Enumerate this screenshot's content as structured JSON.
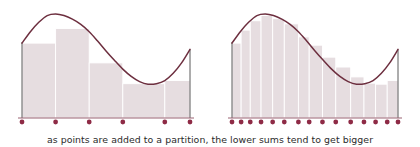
{
  "caption": "as points are added to a partition, the lower sums tend to get bigger",
  "colors": {
    "curve": "#6d2f3f",
    "bar_fill": "#e6dde0",
    "bar_edge": "#ffffff",
    "axis": "#5a5a5a",
    "dot": "#8e2b46",
    "baseline": "#9a6273",
    "background": "#ffffff",
    "caption_text": "#2b2b2b"
  },
  "chart_data": {
    "type": "area",
    "title": "",
    "subtitle": "",
    "xlabel": "",
    "ylabel": "",
    "grid": false,
    "legend": null,
    "panels": [
      {
        "name": "coarse-partition",
        "description": "lower sum rectangles over a coarse partition",
        "x_domain": [
          0,
          1
        ],
        "y_domain": [
          0,
          1
        ],
        "partition_points": [
          0.0,
          0.2,
          0.4,
          0.6,
          0.85,
          1.0
        ],
        "partition_point_count": 6,
        "bar_count": 5,
        "bar_values": [
          0.72,
          0.86,
          0.53,
          0.33,
          0.36
        ],
        "curve_samples": [
          {
            "x": 0.0,
            "y": 0.72
          },
          {
            "x": 0.05,
            "y": 0.83
          },
          {
            "x": 0.1,
            "y": 0.92
          },
          {
            "x": 0.15,
            "y": 0.985
          },
          {
            "x": 0.2,
            "y": 1.0
          },
          {
            "x": 0.25,
            "y": 0.985
          },
          {
            "x": 0.3,
            "y": 0.95
          },
          {
            "x": 0.35,
            "y": 0.9
          },
          {
            "x": 0.4,
            "y": 0.83
          },
          {
            "x": 0.45,
            "y": 0.74
          },
          {
            "x": 0.5,
            "y": 0.645
          },
          {
            "x": 0.55,
            "y": 0.555
          },
          {
            "x": 0.6,
            "y": 0.47
          },
          {
            "x": 0.65,
            "y": 0.4
          },
          {
            "x": 0.7,
            "y": 0.35
          },
          {
            "x": 0.75,
            "y": 0.325
          },
          {
            "x": 0.8,
            "y": 0.33
          },
          {
            "x": 0.85,
            "y": 0.36
          },
          {
            "x": 0.9,
            "y": 0.43
          },
          {
            "x": 0.95,
            "y": 0.53
          },
          {
            "x": 1.0,
            "y": 0.66
          }
        ]
      },
      {
        "name": "fine-partition",
        "description": "lower sum rectangles over a finer partition",
        "x_domain": [
          0,
          1
        ],
        "y_domain": [
          0,
          1
        ],
        "partition_points": [
          0.0,
          0.055,
          0.11,
          0.175,
          0.245,
          0.315,
          0.4,
          0.465,
          0.545,
          0.625,
          0.715,
          0.795,
          0.865,
          0.935,
          1.0
        ],
        "partition_point_count": 15,
        "bar_count": 14,
        "bar_values": [
          0.72,
          0.845,
          0.935,
          0.985,
          0.955,
          0.905,
          0.78,
          0.7,
          0.585,
          0.49,
          0.395,
          0.335,
          0.325,
          0.36
        ],
        "curve_samples": [
          {
            "x": 0.0,
            "y": 0.72
          },
          {
            "x": 0.05,
            "y": 0.83
          },
          {
            "x": 0.1,
            "y": 0.92
          },
          {
            "x": 0.15,
            "y": 0.985
          },
          {
            "x": 0.2,
            "y": 1.0
          },
          {
            "x": 0.25,
            "y": 0.985
          },
          {
            "x": 0.3,
            "y": 0.95
          },
          {
            "x": 0.35,
            "y": 0.9
          },
          {
            "x": 0.4,
            "y": 0.83
          },
          {
            "x": 0.45,
            "y": 0.74
          },
          {
            "x": 0.5,
            "y": 0.645
          },
          {
            "x": 0.55,
            "y": 0.555
          },
          {
            "x": 0.6,
            "y": 0.47
          },
          {
            "x": 0.65,
            "y": 0.4
          },
          {
            "x": 0.7,
            "y": 0.35
          },
          {
            "x": 0.75,
            "y": 0.325
          },
          {
            "x": 0.8,
            "y": 0.33
          },
          {
            "x": 0.85,
            "y": 0.36
          },
          {
            "x": 0.9,
            "y": 0.43
          },
          {
            "x": 0.95,
            "y": 0.53
          },
          {
            "x": 1.0,
            "y": 0.66
          }
        ]
      }
    ]
  },
  "layout": {
    "panel_left": {
      "x0": 22,
      "x1": 190,
      "baseline_y": 118,
      "top_y": 14
    },
    "panel_right": {
      "x0": 232,
      "x1": 398,
      "baseline_y": 118,
      "top_y": 14
    },
    "dot_radius": 2.4,
    "curve_width": 1.5
  }
}
